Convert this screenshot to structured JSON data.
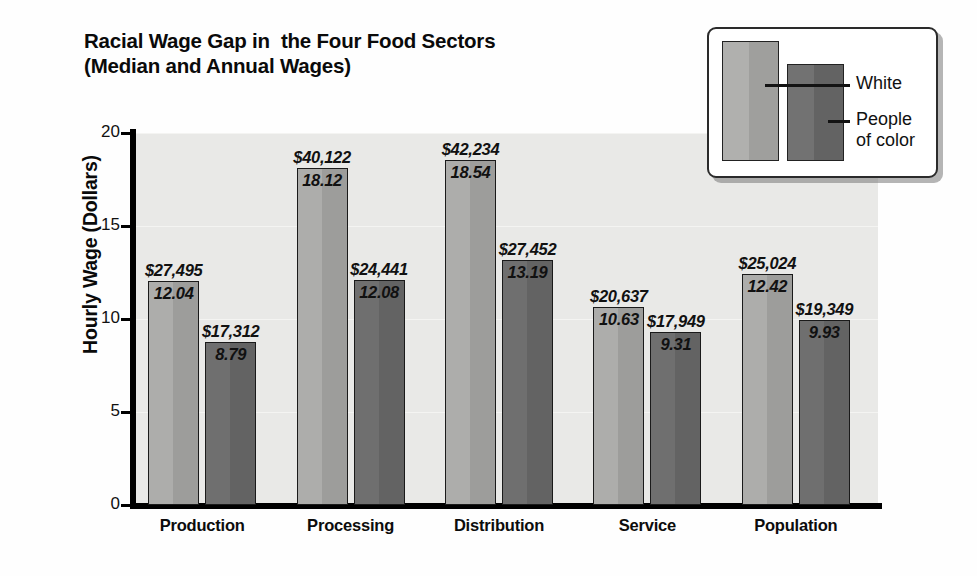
{
  "chart_data": {
    "type": "bar",
    "title": "Racial Wage Gap in  the Four Food Sectors",
    "subtitle": "(Median and Annual Wages)",
    "xlabel": "",
    "ylabel": "Hourly Wage (Dollars)",
    "ylim": [
      0,
      20
    ],
    "yticks": [
      0,
      5,
      10,
      15,
      20
    ],
    "ytick_labels": [
      "0",
      "5",
      "10",
      "15",
      "20"
    ],
    "grid": true,
    "legend_position": "top-right",
    "categories": [
      "Production",
      "Processing",
      "Distribution",
      "Service",
      "Population"
    ],
    "series": [
      {
        "name": "White",
        "color": "#a8a8a6",
        "values": [
          12.04,
          18.12,
          18.54,
          10.63,
          12.42
        ],
        "annual_wages": [
          "$27,495",
          "$40,122",
          "$42,234",
          "$20,637",
          "$25,024"
        ],
        "hourly_labels": [
          "12.04",
          "18.12",
          "18.54",
          "10.63",
          "12.42"
        ]
      },
      {
        "name": "People of color",
        "color": "#6b6b6b",
        "values": [
          8.79,
          12.08,
          13.19,
          9.31,
          9.93
        ],
        "annual_wages": [
          "$17,312",
          "$24,441",
          "$27,452",
          "$17,949",
          "$19,349"
        ],
        "hourly_labels": [
          "8.79",
          "12.08",
          "13.19",
          "9.31",
          "9.93"
        ]
      }
    ]
  },
  "legend": {
    "white_label": "White",
    "poc_label": "People\nof color"
  },
  "colors": {
    "plot_background": "#e9e9e7",
    "gridline": "#f4f4f2",
    "axis": "#000000",
    "white_bar": "#a8a8a6",
    "poc_bar": "#6b6b6b"
  }
}
